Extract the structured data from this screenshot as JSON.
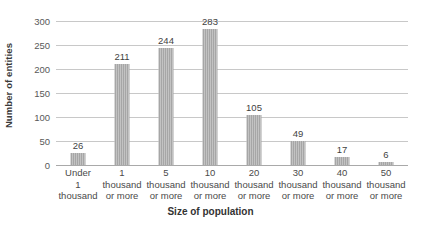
{
  "chart_data": {
    "type": "bar",
    "title": "",
    "xlabel": "Size of population",
    "ylabel": "Number of entities",
    "categories": [
      "Under 1 thousand",
      "1 thousand or more",
      "5 thousand or more",
      "10 thousand or more",
      "20 thousand or more",
      "30 thousand or more",
      "40 thousand or more",
      "50 thousand or more"
    ],
    "category_lines": [
      [
        "Under",
        "1",
        "thousand"
      ],
      [
        "1",
        "thousand",
        "or more"
      ],
      [
        "5",
        "thousand",
        "or more"
      ],
      [
        "10",
        "thousand",
        "or more"
      ],
      [
        "20",
        "thousand",
        "or more"
      ],
      [
        "30",
        "thousand",
        "or more"
      ],
      [
        "40",
        "thousand",
        "or more"
      ],
      [
        "50",
        "thousand",
        "or more"
      ]
    ],
    "values": [
      26,
      211,
      244,
      283,
      105,
      49,
      17,
      6
    ],
    "ylim": [
      0,
      300
    ],
    "yticks": [
      0,
      50,
      100,
      150,
      200,
      250,
      300
    ],
    "ytick_labels": [
      "0",
      "50",
      "100",
      "150",
      "200",
      "250",
      "300"
    ],
    "data_labels": [
      "26",
      "211",
      "244",
      "283",
      "105",
      "49",
      "17",
      "6"
    ],
    "grid": "horizontal",
    "legend": "none",
    "bar_color": "#a6a6a6",
    "gridline_color": "#c8c8c8",
    "background_color": "#ffffff"
  }
}
